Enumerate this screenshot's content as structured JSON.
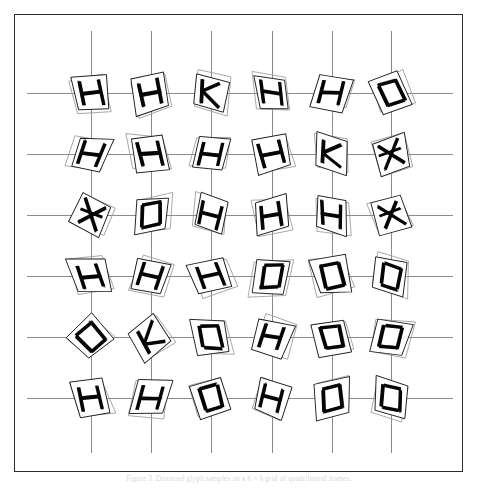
{
  "figure": {
    "caption": "Figure 3.  Distorted glyph samples on a 6 × 6 grid of quadrilateral frames.",
    "border_color": "#2b2b2b",
    "gridline_color": "#8b8b8b",
    "ink_color": "#050505",
    "background": "#ffffff"
  },
  "plot": {
    "frame": {
      "left": 14,
      "top": 14,
      "width": 449,
      "height": 458
    },
    "columns_x": [
      90,
      150,
      210,
      271,
      331,
      390
    ],
    "rows_y": [
      92,
      153,
      214,
      275,
      336,
      397
    ],
    "grid_line_top": 30,
    "grid_line_bottom": 452,
    "grid_line_left": 26,
    "grid_line_right": 452
  },
  "chart_data": {
    "type": "scatter",
    "title": "",
    "xlabel": "",
    "ylabel": "",
    "grid": true,
    "legend": null,
    "rows": 6,
    "columns": 6,
    "x": [
      90,
      150,
      210,
      271,
      331,
      390
    ],
    "y": [
      92,
      153,
      214,
      275,
      336,
      397
    ],
    "cells": [
      {
        "row": 0,
        "col": 0,
        "label": "H",
        "rotation": -10,
        "shear": 6,
        "scale": 1.02
      },
      {
        "row": 0,
        "col": 1,
        "label": "H",
        "rotation": -16,
        "shear": -4,
        "scale": 1.04
      },
      {
        "row": 0,
        "col": 2,
        "label": "K",
        "rotation": 8,
        "shear": 10,
        "scale": 1.0
      },
      {
        "row": 0,
        "col": 3,
        "label": "H",
        "rotation": -4,
        "shear": 14,
        "scale": 0.98
      },
      {
        "row": 0,
        "col": 4,
        "label": "H",
        "rotation": 12,
        "shear": -8,
        "scale": 1.03
      },
      {
        "row": 0,
        "col": 5,
        "label": "D",
        "rotation": -20,
        "shear": 5,
        "scale": 1.01
      },
      {
        "row": 1,
        "col": 0,
        "label": "H",
        "rotation": 16,
        "shear": -10,
        "scale": 1.0
      },
      {
        "row": 1,
        "col": 1,
        "label": "H",
        "rotation": -6,
        "shear": 8,
        "scale": 1.05
      },
      {
        "row": 1,
        "col": 2,
        "label": "H",
        "rotation": 10,
        "shear": -6,
        "scale": 0.99
      },
      {
        "row": 1,
        "col": 3,
        "label": "H",
        "rotation": -14,
        "shear": 3,
        "scale": 1.02
      },
      {
        "row": 1,
        "col": 4,
        "label": "K",
        "rotation": 6,
        "shear": 12,
        "scale": 1.0
      },
      {
        "row": 1,
        "col": 5,
        "label": "X",
        "rotation": -18,
        "shear": -5,
        "scale": 1.03
      },
      {
        "row": 2,
        "col": 0,
        "label": "X",
        "rotation": 22,
        "shear": 4,
        "scale": 1.04
      },
      {
        "row": 2,
        "col": 1,
        "label": "D",
        "rotation": -5,
        "shear": -9,
        "scale": 1.0
      },
      {
        "row": 2,
        "col": 2,
        "label": "H",
        "rotation": 14,
        "shear": 7,
        "scale": 0.98
      },
      {
        "row": 2,
        "col": 3,
        "label": "H",
        "rotation": -12,
        "shear": -3,
        "scale": 1.02
      },
      {
        "row": 2,
        "col": 4,
        "label": "H",
        "rotation": 4,
        "shear": 11,
        "scale": 1.01
      },
      {
        "row": 2,
        "col": 5,
        "label": "X",
        "rotation": -22,
        "shear": 6,
        "scale": 1.0
      },
      {
        "row": 3,
        "col": 0,
        "label": "H",
        "rotation": -8,
        "shear": 13,
        "scale": 1.03
      },
      {
        "row": 3,
        "col": 1,
        "label": "H",
        "rotation": 18,
        "shear": -6,
        "scale": 0.99
      },
      {
        "row": 3,
        "col": 2,
        "label": "H",
        "rotation": -16,
        "shear": 9,
        "scale": 1.02
      },
      {
        "row": 3,
        "col": 3,
        "label": "D",
        "rotation": 7,
        "shear": -11,
        "scale": 1.0
      },
      {
        "row": 3,
        "col": 4,
        "label": "D",
        "rotation": -10,
        "shear": 4,
        "scale": 1.04
      },
      {
        "row": 3,
        "col": 5,
        "label": "D",
        "rotation": 13,
        "shear": 8,
        "scale": 0.98
      },
      {
        "row": 4,
        "col": 0,
        "label": "D",
        "rotation": -42,
        "shear": 2,
        "scale": 1.02
      },
      {
        "row": 4,
        "col": 1,
        "label": "K",
        "rotation": -35,
        "shear": -7,
        "scale": 1.01
      },
      {
        "row": 4,
        "col": 2,
        "label": "D",
        "rotation": -6,
        "shear": 10,
        "scale": 1.0
      },
      {
        "row": 4,
        "col": 3,
        "label": "H",
        "rotation": 15,
        "shear": -4,
        "scale": 1.03
      },
      {
        "row": 4,
        "col": 4,
        "label": "D",
        "rotation": -13,
        "shear": 6,
        "scale": 0.99
      },
      {
        "row": 4,
        "col": 5,
        "label": "D",
        "rotation": 9,
        "shear": -9,
        "scale": 1.02
      },
      {
        "row": 5,
        "col": 0,
        "label": "H",
        "rotation": -11,
        "shear": 7,
        "scale": 1.01
      },
      {
        "row": 5,
        "col": 1,
        "label": "H",
        "rotation": 5,
        "shear": -12,
        "scale": 1.0
      },
      {
        "row": 5,
        "col": 2,
        "label": "D",
        "rotation": -17,
        "shear": 5,
        "scale": 1.03
      },
      {
        "row": 5,
        "col": 3,
        "label": "H",
        "rotation": 20,
        "shear": 3,
        "scale": 0.98
      },
      {
        "row": 5,
        "col": 4,
        "label": "D",
        "rotation": -7,
        "shear": -8,
        "scale": 1.02
      },
      {
        "row": 5,
        "col": 5,
        "label": "D",
        "rotation": 11,
        "shear": 9,
        "scale": 1.0
      }
    ]
  }
}
